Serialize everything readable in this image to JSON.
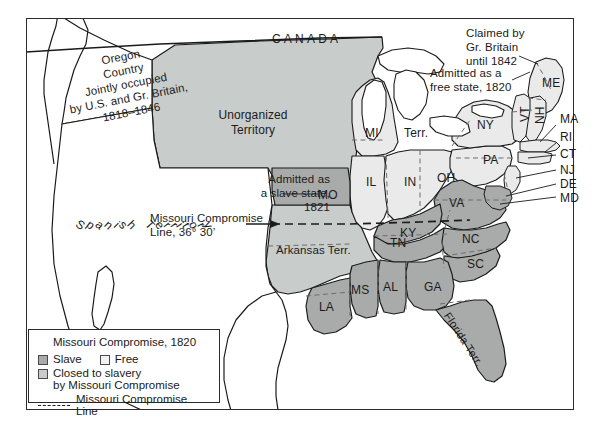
{
  "map": {
    "title": "Missouri Compromise, 1820",
    "regions": {
      "canada": "CANADA",
      "unorganized_territory": "Unorganized\nTerritory",
      "unorganized_line1": "Unorganized",
      "unorganized_line2": "Territory",
      "spanish_territory": "Spanish Territory",
      "arkansas_territory": "Arkansas Terr.",
      "florida_territory": "Florida Terr.",
      "michigan_territory_abbr": "MI",
      "michigan_territory_word": "Terr."
    },
    "annotations": [
      {
        "name": "oregon-country",
        "lines": [
          "Oregon",
          "Country",
          "Jointly occupied",
          "by U.S. and Gr. Britain,",
          "1818–1846"
        ]
      },
      {
        "name": "claimed-by-britain",
        "lines": [
          "Claimed by",
          "Gr. Britain",
          "until 1842"
        ]
      },
      {
        "name": "admitted-free-state",
        "lines": [
          "Admitted as a",
          "free state, 1820"
        ]
      },
      {
        "name": "admitted-slave-state",
        "lines": [
          "Admitted as",
          "a slave state,",
          "1821"
        ]
      },
      {
        "name": "missouri-compromise-line-callout",
        "lines": [
          "Missouri Compromise",
          "Line, 36° 30’"
        ]
      }
    ],
    "state_labels": [
      {
        "id": "MI",
        "text": "MI"
      },
      {
        "id": "TERR",
        "text": "Terr."
      },
      {
        "id": "IL",
        "text": "IL"
      },
      {
        "id": "IN",
        "text": "IN"
      },
      {
        "id": "OH",
        "text": "OH"
      },
      {
        "id": "NY",
        "text": "NY"
      },
      {
        "id": "PA",
        "text": "PA"
      },
      {
        "id": "ME",
        "text": "ME"
      },
      {
        "id": "VT",
        "text": "VT"
      },
      {
        "id": "NH",
        "text": "NH"
      },
      {
        "id": "MA",
        "text": "MA"
      },
      {
        "id": "RI",
        "text": "RI"
      },
      {
        "id": "CT",
        "text": "CT"
      },
      {
        "id": "NJ",
        "text": "NJ"
      },
      {
        "id": "DE",
        "text": "DE"
      },
      {
        "id": "MD",
        "text": "MD"
      },
      {
        "id": "VA",
        "text": "VA"
      },
      {
        "id": "KY",
        "text": "KY"
      },
      {
        "id": "MO",
        "text": "MO"
      },
      {
        "id": "TN",
        "text": "TN"
      },
      {
        "id": "NC",
        "text": "NC"
      },
      {
        "id": "SC",
        "text": "SC"
      },
      {
        "id": "GA",
        "text": "GA"
      },
      {
        "id": "AL",
        "text": "AL"
      },
      {
        "id": "MS",
        "text": "MS"
      },
      {
        "id": "LA",
        "text": "LA"
      }
    ]
  },
  "legend": {
    "title": "Missouri Compromise, 1820",
    "slave_label": "Slave",
    "free_label": "Free",
    "closed_label_line1": "Closed to slavery",
    "closed_label_line2": "by Missouri Compromise",
    "line_label": "Missouri Compromise Line"
  },
  "colors": {
    "slave": "#a9abaa",
    "free": "#e9eae9",
    "closed": "#c8cccb",
    "unassigned": "#ffffff",
    "outline": "#1b1b1b",
    "internal_border": "#6d6d6d",
    "frame": "#2b2b2b",
    "text": "#1b1b1b"
  }
}
